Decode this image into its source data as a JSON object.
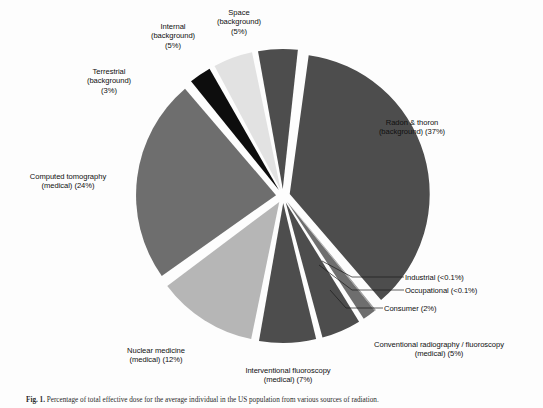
{
  "figure": {
    "caption_prefix": "Fig. 1.",
    "caption_text": "Percentage of total effective dose for the average individual in the US population from various sources of radiation."
  },
  "chart_data": {
    "type": "pie",
    "title": "",
    "subtitle": "",
    "xlabel": "",
    "ylabel": "",
    "legend_position": "none",
    "grid": false,
    "exploded": true,
    "units": "percent",
    "total": 100,
    "categories": [
      "Radon & thoron (background)",
      "Computed tomography (medical)",
      "Nuclear medicine (medical)",
      "Interventional fluoroscopy (medical)",
      "Conventional radiography / fluoroscopy (medical)",
      "Consumer",
      "Occupational",
      "Industrial",
      "Space (background)",
      "Internal (background)",
      "Terrestrial (background)"
    ],
    "values": [
      37,
      24,
      12,
      7,
      5,
      2,
      0.05,
      0.05,
      5,
      5,
      3
    ],
    "value_labels": [
      "37%",
      "24%",
      "12%",
      "7%",
      "5%",
      "2%",
      "<0.1%",
      "<0.1%",
      "5%",
      "5%",
      "3%"
    ],
    "colors": [
      "#4d4d4d",
      "#6e6e6e",
      "#b6b6b6",
      "#4d4d4d",
      "#4d4d4d",
      "#6e6e6e",
      "#9a9a9a",
      "#9a9a9a",
      "#4d4d4d",
      "#e2e2e2",
      "#0d0d0d"
    ],
    "slices": [
      {
        "name": "radon-thoron",
        "label_line1": "Radon & thoron",
        "label_line2": "(background) (37%)",
        "percent": 37,
        "percent_label": "37%",
        "color": "#4d4d4d"
      },
      {
        "name": "industrial",
        "label_line1": "Industrial (<0.1%)",
        "label_line2": "",
        "percent": 0.05,
        "percent_label": "<0.1%",
        "color": "#9a9a9a"
      },
      {
        "name": "occupational",
        "label_line1": "Occupational (<0.1%)",
        "label_line2": "",
        "percent": 0.05,
        "percent_label": "<0.1%",
        "color": "#9a9a9a"
      },
      {
        "name": "consumer",
        "label_line1": "Consumer (2%)",
        "label_line2": "",
        "percent": 2,
        "percent_label": "2%",
        "color": "#6e6e6e"
      },
      {
        "name": "conventional-radiography",
        "label_line1": "Conventional radiography / fluoroscopy",
        "label_line2": "(medical) (5%)",
        "percent": 5,
        "percent_label": "5%",
        "color": "#4d4d4d"
      },
      {
        "name": "interventional-fluoroscopy",
        "label_line1": "Interventional fluoroscopy",
        "label_line2": "(medical) (7%)",
        "percent": 7,
        "percent_label": "7%",
        "color": "#4d4d4d"
      },
      {
        "name": "nuclear-medicine",
        "label_line1": "Nuclear medicine",
        "label_line2": "(medical) (12%)",
        "percent": 12,
        "percent_label": "12%",
        "color": "#b6b6b6"
      },
      {
        "name": "computed-tomography",
        "label_line1": "Computed tomography",
        "label_line2": "(medical) (24%)",
        "percent": 24,
        "percent_label": "24%",
        "color": "#6e6e6e"
      },
      {
        "name": "terrestrial",
        "label_line1": "Terrestrial",
        "label_line2": "(background)\n(3%)",
        "percent": 3,
        "percent_label": "3%",
        "color": "#0d0d0d"
      },
      {
        "name": "internal",
        "label_line1": "Internal",
        "label_line2": "(background)\n(5%)",
        "percent": 5,
        "percent_label": "5%",
        "color": "#e2e2e2"
      },
      {
        "name": "space",
        "label_line1": "Space",
        "label_line2": "(background)\n(5%)",
        "percent": 5,
        "percent_label": "5%",
        "color": "#4d4d4d"
      }
    ]
  },
  "labels": {
    "radon": "Radon & thoron\n(background) (37%)",
    "space": "Space\n(background)\n(5%)",
    "internal": "Internal\n(background)\n(5%)",
    "terrestrial": "Terrestrial\n(background)\n(3%)",
    "computed_tomography": "Computed tomography\n(medical) (24%)",
    "nuclear_medicine": "Nuclear medicine\n(medical) (12%)",
    "interventional": "Interventional fluoroscopy\n(medical) (7%)",
    "conventional": "Conventional radiography / fluoroscopy\n(medical) (5%)",
    "consumer": "Consumer (2%)",
    "occupational": "Occupational (<0.1%)",
    "industrial": "Industrial (<0.1%)"
  }
}
